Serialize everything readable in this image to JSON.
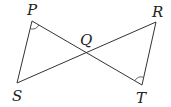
{
  "diagram": {
    "type": "geometry",
    "points": {
      "P": {
        "label": "P",
        "x": 32,
        "y": 21
      },
      "R": {
        "label": "R",
        "x": 156,
        "y": 22
      },
      "S": {
        "label": "S",
        "x": 17,
        "y": 83
      },
      "T": {
        "label": "T",
        "x": 142,
        "y": 85
      },
      "Q": {
        "label": "Q",
        "x": 90,
        "y": 51
      }
    },
    "segments": [
      [
        "P",
        "S"
      ],
      [
        "P",
        "T"
      ],
      [
        "R",
        "S"
      ],
      [
        "R",
        "T"
      ]
    ],
    "angle_marks": [
      {
        "vertex": "P",
        "between": [
          "S",
          "T"
        ]
      },
      {
        "vertex": "T",
        "between": [
          "P",
          "R"
        ]
      }
    ],
    "labels": {
      "P": "P",
      "Q": "Q",
      "R": "R",
      "S": "S",
      "T": "T"
    }
  }
}
